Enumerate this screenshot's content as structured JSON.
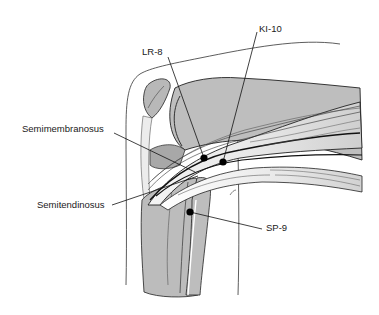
{
  "diagram": {
    "colors": {
      "background": "#ffffff",
      "muscle_fill": "#bdbdbd",
      "muscle_dark": "#a9a9a9",
      "tendon_fill": "#f2f2f2",
      "outline": "#1a1a1a",
      "point": "#000000"
    },
    "labels": {
      "semimembranosus": "Semimembranosus",
      "semitendinosus": "Semitendinosus",
      "lr8": "LR-8",
      "ki10": "KI-10",
      "sp9": "SP-9"
    },
    "points": [
      {
        "id": "LR-8",
        "x": 204,
        "y": 158
      },
      {
        "id": "KI-10",
        "x": 223,
        "y": 162
      },
      {
        "id": "SP-9",
        "x": 190,
        "y": 212
      }
    ]
  }
}
